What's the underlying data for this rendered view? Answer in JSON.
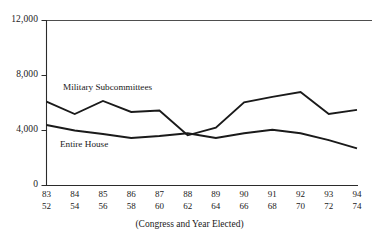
{
  "chart_data": {
    "type": "line",
    "title": "",
    "subtitle": "",
    "xlabel": "(Congress and Year Elected)",
    "ylabel": "",
    "ylim": [
      0,
      12000
    ],
    "yticks": [
      0,
      4000,
      8000,
      12000
    ],
    "ytick_labels": [
      "0",
      "4,000",
      "8,000",
      "12,000"
    ],
    "grid": false,
    "legend_position": "inline-annotation",
    "categories": [
      "83",
      "84",
      "85",
      "86",
      "87",
      "88",
      "89",
      "90",
      "91",
      "92",
      "93",
      "94"
    ],
    "x_secondary_label": "Year Elected",
    "x_secondary": [
      "52",
      "54",
      "56",
      "58",
      "60",
      "62",
      "64",
      "66",
      "68",
      "70",
      "72",
      "74"
    ],
    "series": [
      {
        "name": "Military Subcommittees",
        "values": [
          6100,
          5200,
          6150,
          5350,
          5450,
          3650,
          4200,
          6050,
          6450,
          6800,
          5200,
          5500
        ]
      },
      {
        "name": "Entire House",
        "values": [
          4400,
          4000,
          3750,
          3450,
          3600,
          3800,
          3450,
          3800,
          4050,
          3800,
          3300,
          2700
        ]
      }
    ],
    "annotations": [
      {
        "text": "Military Subcommittees",
        "series": "Military Subcommittees"
      },
      {
        "text": "Entire House",
        "series": "Entire House"
      }
    ],
    "colors": {
      "line": "#1a1a1a",
      "axis": "#2b2b2b",
      "background": "#ffffff",
      "text": "#1a1a1a"
    }
  }
}
